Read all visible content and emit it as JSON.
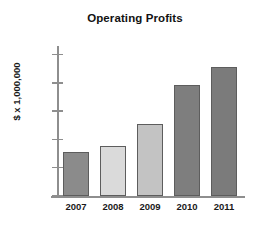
{
  "chart_data": {
    "type": "bar",
    "title": "Operating Profits",
    "xlabel": "",
    "ylabel": "$ x 1,000,000",
    "categories": [
      "2007",
      "2008",
      "2009",
      "2010",
      "2011"
    ],
    "values": [
      7.8,
      8.9,
      12.8,
      19.7,
      22.8
    ],
    "series": [
      {
        "name": "Operating Profits",
        "values": [
          7.8,
          8.9,
          12.8,
          19.7,
          22.8
        ]
      }
    ],
    "ylim": [
      0,
      26.5
    ],
    "yticks": [
      0,
      5,
      10,
      15,
      20,
      25
    ],
    "ytick_labels": [
      "0",
      "5",
      "10",
      "15",
      "20",
      "25"
    ],
    "grid": false,
    "legend": "none",
    "bar_colors": [
      "#8b8b8b",
      "#dadada",
      "#c3c3c3",
      "#7e7e7e",
      "#7b7b7b"
    ],
    "bar_edge_color": "#5d5d5d",
    "axis_color": "#8e8e8e",
    "background_color": "#ffffff",
    "text_color": "#1a1a1a"
  }
}
